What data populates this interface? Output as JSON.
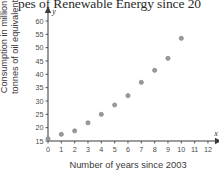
{
  "chart_data": {
    "type": "scatter",
    "title": "pes of Renewable Energy since 20",
    "xlabel": "Number of years since 2003",
    "ylabel_line1": "Consumption in million",
    "ylabel_line2": "tonnes of oil equivalent",
    "x_axis_letter": "x",
    "y_axis_letter": "y",
    "xlim": [
      0,
      12
    ],
    "ylim": [
      15,
      60
    ],
    "xticks": [
      0,
      1,
      2,
      3,
      4,
      5,
      6,
      7,
      8,
      9,
      10,
      11,
      12
    ],
    "yticks": [
      15,
      20,
      25,
      30,
      35,
      40,
      45,
      50,
      55,
      60
    ],
    "xtick_labels": [
      "0",
      "1",
      "2",
      "3",
      "4",
      "5",
      "6",
      "7",
      "8",
      "9",
      "10",
      "11",
      "12"
    ],
    "ytick_labels": [
      "15",
      "20",
      "25",
      "30",
      "35",
      "40",
      "45",
      "50",
      "55",
      "60"
    ],
    "grid": false,
    "legend": "none",
    "marker": "circle",
    "marker_color": "#9a9a9f",
    "x": [
      0,
      1,
      2,
      3,
      4,
      5,
      6,
      7,
      8,
      9,
      10
    ],
    "y": [
      15.8,
      17.5,
      18.8,
      21.8,
      25.0,
      28.5,
      32.0,
      37.0,
      41.5,
      46.0,
      53.5
    ],
    "points": [
      {
        "x": 0,
        "y": 15.8
      },
      {
        "x": 1,
        "y": 17.5
      },
      {
        "x": 2,
        "y": 18.8
      },
      {
        "x": 3,
        "y": 21.8
      },
      {
        "x": 4,
        "y": 25.0
      },
      {
        "x": 5,
        "y": 28.5
      },
      {
        "x": 6,
        "y": 32.0
      },
      {
        "x": 7,
        "y": 37.0
      },
      {
        "x": 8,
        "y": 41.5
      },
      {
        "x": 9,
        "y": 46.0
      },
      {
        "x": 10,
        "y": 53.5
      }
    ]
  }
}
